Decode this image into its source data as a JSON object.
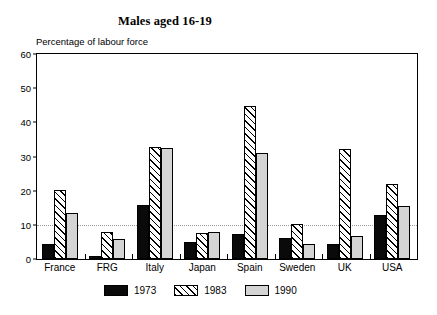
{
  "chart_data": {
    "type": "bar",
    "title": "Males aged 16-19",
    "ylabel": "Percentage of labour force",
    "xlabel": "",
    "categories": [
      "France",
      "FRG",
      "Italy",
      "Japan",
      "Spain",
      "Sweden",
      "UK",
      "USA"
    ],
    "series": [
      {
        "name": "1973",
        "values": [
          4.5,
          1.0,
          15.7,
          5.0,
          7.3,
          6.2,
          4.5,
          12.8
        ]
      },
      {
        "name": "1983",
        "values": [
          20.3,
          8.0,
          32.8,
          7.5,
          44.8,
          10.3,
          32.3,
          22.0
        ]
      },
      {
        "name": "1990",
        "values": [
          13.4,
          6.0,
          32.5,
          7.8,
          31.0,
          4.5,
          6.8,
          15.5
        ]
      }
    ],
    "ylim": [
      0,
      60
    ],
    "yticks": [
      0,
      10,
      20,
      30,
      40,
      50,
      60
    ],
    "ytick_labels": [
      "0",
      "10",
      "20",
      "30",
      "40",
      "50",
      "60"
    ],
    "gridlines": [
      10
    ],
    "grid": "dotted horizontal gridline at 10 only",
    "legend_position": "below-axis-center",
    "legend_entries": [
      "1973",
      "1983",
      "1990"
    ],
    "colors": {
      "series_1973": "#0a0a0a",
      "series_1983": "#ffffff",
      "series_1983_hatch": "#000000",
      "series_1990": "#d4d4d4",
      "axis": "#000000",
      "gridline": "#9a9a9a",
      "background": "#ffffff"
    }
  }
}
